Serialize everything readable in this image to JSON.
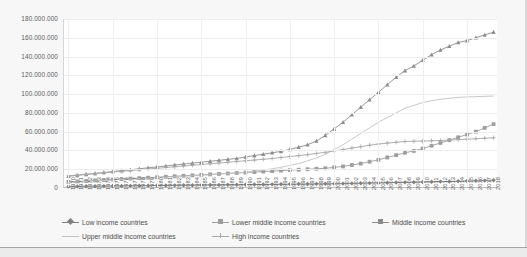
{
  "chart_data": {
    "type": "line",
    "title": "",
    "xlabel": "",
    "ylabel": "",
    "ylim": [
      0,
      180000000
    ],
    "ytick_labels": [
      "180.000.000",
      "160.000.000",
      "140.000.000",
      "120.000.000",
      "100.000.000",
      "80.000.000",
      "60.000.000",
      "40.000.000",
      "20.000.000",
      "0"
    ],
    "ytick_values": [
      180000000,
      160000000,
      140000000,
      120000000,
      100000000,
      80000000,
      60000000,
      40000000,
      20000000,
      0
    ],
    "grid": true,
    "legend_position": "bottom",
    "categories": [
      1970,
      1971,
      1972,
      1973,
      1974,
      1975,
      1976,
      1977,
      1978,
      1979,
      1980,
      1981,
      1982,
      1983,
      1984,
      1985,
      1986,
      1987,
      1988,
      1989,
      1990,
      1991,
      1992,
      1993,
      1994,
      1995,
      1996,
      1997,
      1998,
      1999,
      2000,
      2001,
      2002,
      2003,
      2004,
      2005,
      2006,
      2007,
      2008,
      2009,
      2010,
      2011,
      2012,
      2013,
      2014,
      2015,
      2016,
      2017,
      2018
    ],
    "series": [
      {
        "name": "Low income countries",
        "marker": "diamond",
        "color": "#808080",
        "values": [
          1600000,
          1700000,
          1800000,
          1900000,
          2000000,
          2100000,
          2200000,
          2300000,
          2400000,
          2500000,
          2600000,
          2700000,
          2800000,
          2900000,
          3000000,
          3100000,
          3200000,
          3300000,
          3400000,
          3500000,
          3600000,
          3700000,
          3800000,
          3900000,
          4000000,
          4100000,
          4200000,
          4300000,
          4400000,
          4500000,
          4600000,
          4700000,
          4900000,
          5000000,
          5200000,
          5400000,
          5600000,
          5800000,
          6000000,
          6200000,
          6400000,
          6600000,
          6800000,
          7000000,
          7300000,
          7500000,
          7800000,
          8000000,
          8300000
        ]
      },
      {
        "name": "Lower middle income countries",
        "marker": "square",
        "color": "#9e9e9e",
        "values": [
          6500000,
          7000000,
          7500000,
          8000000,
          8500000,
          9000000,
          9500000,
          10000000,
          10500000,
          11000000,
          11500000,
          12000000,
          12500000,
          13000000,
          13500000,
          14000000,
          14500000,
          15000000,
          15500000,
          16000000,
          16500000,
          17000000,
          17500000,
          18000000,
          18500000,
          19000000,
          19500000,
          20000000,
          20500000,
          21000000,
          22000000,
          23000000,
          24500000,
          26000000,
          28000000,
          30000000,
          32500000,
          35000000,
          37500000,
          39500000,
          42000000,
          45000000,
          48000000,
          51000000,
          54000000,
          57000000,
          60000000,
          64000000,
          68000000
        ]
      },
      {
        "name": "Middle income countries",
        "marker": "triangle",
        "color": "#8c8c8c",
        "values": [
          12500000,
          13500000,
          14500000,
          15500000,
          16500000,
          17500000,
          18500000,
          19500000,
          20500000,
          21500000,
          22500000,
          23500000,
          24500000,
          25500000,
          26500000,
          27500000,
          28500000,
          29500000,
          30500000,
          31500000,
          33000000,
          34500000,
          36000000,
          37500000,
          39000000,
          41000000,
          43500000,
          46000000,
          50000000,
          56000000,
          63000000,
          70000000,
          78000000,
          86000000,
          94000000,
          102000000,
          110000000,
          118000000,
          125000000,
          130000000,
          136000000,
          142000000,
          147000000,
          151000000,
          155000000,
          157000000,
          160000000,
          163000000,
          166000000
        ]
      },
      {
        "name": "Upper middle income countries",
        "marker": "line",
        "color": "#c2c2c2",
        "values": [
          6000000,
          6500000,
          7000000,
          7500000,
          8000000,
          8500000,
          9000000,
          9500000,
          10000000,
          10500000,
          11000000,
          11500000,
          12000000,
          12500000,
          13000000,
          13500000,
          14000000,
          15000000,
          15500000,
          16000000,
          17000000,
          18000000,
          19000000,
          20500000,
          22000000,
          24000000,
          26000000,
          29000000,
          32000000,
          36000000,
          41000000,
          46000000,
          52000000,
          58000000,
          64000000,
          70000000,
          75000000,
          80000000,
          85000000,
          88000000,
          91000000,
          93000000,
          94500000,
          95500000,
          96500000,
          97000000,
          97300000,
          97600000,
          98000000
        ]
      },
      {
        "name": "High income countries",
        "marker": "plus",
        "color": "#a8a8a8",
        "values": [
          13000000,
          13800000,
          14600000,
          15400000,
          16200000,
          17000000,
          17800000,
          18600000,
          19400000,
          20200000,
          21000000,
          21800000,
          22600000,
          23400000,
          24200000,
          25000000,
          25800000,
          26600000,
          27400000,
          28200000,
          29000000,
          29800000,
          30600000,
          31400000,
          32500000,
          33500000,
          34500000,
          35500000,
          36800000,
          38000000,
          39500000,
          41000000,
          42500000,
          44000000,
          45500000,
          46800000,
          47800000,
          48700000,
          49500000,
          49800000,
          50000000,
          50300000,
          50600000,
          51000000,
          51500000,
          52000000,
          52500000,
          53000000,
          53500000
        ]
      }
    ]
  },
  "legend": {
    "items": [
      {
        "label": "Low income countries"
      },
      {
        "label": "Lower middle income countries"
      },
      {
        "label": "Middle income countries"
      },
      {
        "label": "Upper middle income countries"
      },
      {
        "label": "High income countries"
      }
    ]
  }
}
